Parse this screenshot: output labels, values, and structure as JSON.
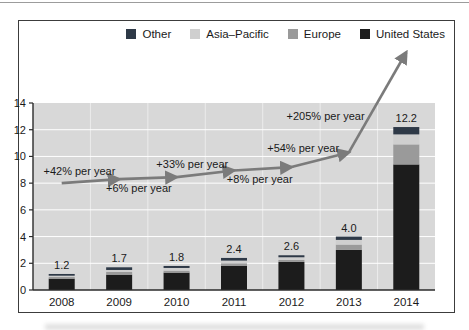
{
  "chart_data": {
    "type": "bar",
    "subtype": "stacked-bars-with-growth-arrow-line",
    "title": "",
    "xlabel": "",
    "ylabel": "",
    "categories": [
      "2008",
      "2009",
      "2010",
      "2011",
      "2012",
      "2013",
      "2014"
    ],
    "stack_series": [
      {
        "name": "United States",
        "color": "#1c1c1c",
        "values": [
          0.85,
          1.15,
          1.3,
          1.8,
          2.1,
          3.0,
          9.4
        ]
      },
      {
        "name": "Europe",
        "color": "#9a9a9a",
        "values": [
          0.12,
          0.2,
          0.15,
          0.2,
          0.15,
          0.4,
          1.5
        ]
      },
      {
        "name": "Asia–Pacific",
        "color": "#cfcfcf",
        "values": [
          0.1,
          0.15,
          0.2,
          0.2,
          0.2,
          0.35,
          0.75
        ]
      },
      {
        "name": "Other",
        "color": "#2e3947",
        "values": [
          0.13,
          0.2,
          0.15,
          0.2,
          0.15,
          0.25,
          0.55
        ]
      }
    ],
    "bar_totals": [
      1.2,
      1.7,
      1.8,
      2.4,
      2.6,
      4.0,
      12.2
    ],
    "total_labels": [
      "1.2",
      "1.7",
      "1.8",
      "2.4",
      "2.6",
      "4.0",
      "12.2"
    ],
    "line": {
      "name": "growth trend",
      "color": "#7b7b7b",
      "values": [
        8.0,
        8.3,
        8.45,
        8.95,
        9.2,
        10.3,
        17.8
      ],
      "note": "schematic arrowed trend line; last arrow exits plot area"
    },
    "annotations": [
      {
        "text": "+42% per year",
        "side": "above"
      },
      {
        "text": "+6% per year",
        "side": "below"
      },
      {
        "text": "+33% per year",
        "side": "above"
      },
      {
        "text": "+8% per year",
        "side": "below"
      },
      {
        "text": "+54% per year",
        "side": "above"
      },
      {
        "text": "+205% per year",
        "side": "left"
      }
    ],
    "legend": [
      {
        "label": "Other",
        "color": "#2e3947"
      },
      {
        "label": "Asia–Pacific",
        "color": "#cfcfcf"
      },
      {
        "label": "Europe",
        "color": "#9a9a9a"
      },
      {
        "label": "United States",
        "color": "#1c1c1c"
      }
    ],
    "legend_position": "top-right",
    "ylim": [
      0,
      14
    ],
    "y_ticks": [
      0,
      2,
      4,
      6,
      8,
      10,
      12,
      14
    ],
    "y_tick_labels": [
      "0",
      "2",
      "4",
      "6",
      "8",
      "10",
      "12",
      "14"
    ],
    "plot_bg": "#d8d8d8",
    "grid": "horizontal white lines at even ticks; faint white vertical lines at category boundaries"
  }
}
